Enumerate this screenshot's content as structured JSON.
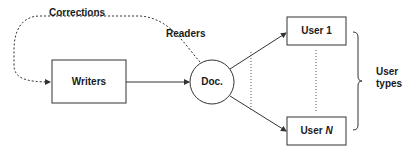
{
  "diagram": {
    "nodes": {
      "writers": {
        "label": "Writers",
        "shape": "rectangle"
      },
      "doc": {
        "label": "Doc.",
        "shape": "circle"
      },
      "user1": {
        "label": "User 1",
        "shape": "rectangle"
      },
      "userN": {
        "label_prefix": "User ",
        "label_var": "N",
        "shape": "rectangle"
      }
    },
    "edges": [
      {
        "from": "writers",
        "to": "doc",
        "style": "solid",
        "arrow": true
      },
      {
        "from": "doc",
        "to": "user1",
        "style": "solid",
        "arrow": true
      },
      {
        "from": "doc",
        "to": "userN",
        "style": "solid",
        "arrow": true
      },
      {
        "from": "doc",
        "to": "writers",
        "style": "dotted",
        "arrow": true,
        "label": "Corrections"
      }
    ],
    "annotations": {
      "corrections": "Corrections",
      "readers": "Readers",
      "user_types_line1": "User",
      "user_types_line2": "types"
    },
    "colors": {
      "stroke": "#333333",
      "text": "#1a1a1a",
      "background": "#ffffff"
    }
  }
}
